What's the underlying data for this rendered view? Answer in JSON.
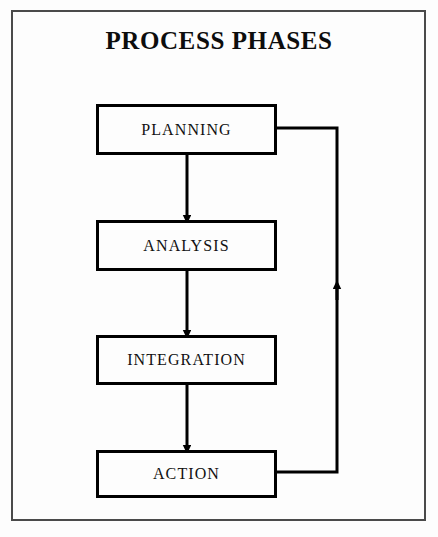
{
  "diagram": {
    "title": "PROCESS PHASES",
    "type": "flowchart",
    "orientation": "vertical",
    "frame_color": "#4a4a4a",
    "box_border_color": "#000000",
    "line_color": "#000000",
    "background_color": "#fdfdfd",
    "nodes": [
      {
        "id": "planning",
        "label": "PLANNING"
      },
      {
        "id": "analysis",
        "label": "ANALYSIS"
      },
      {
        "id": "integration",
        "label": "INTEGRATION"
      },
      {
        "id": "action",
        "label": "ACTION"
      }
    ],
    "edges": [
      {
        "from": "planning",
        "to": "analysis",
        "kind": "arrow-down"
      },
      {
        "from": "analysis",
        "to": "integration",
        "kind": "arrow-down"
      },
      {
        "from": "integration",
        "to": "action",
        "kind": "arrow-down"
      },
      {
        "from": "action",
        "to": "planning",
        "kind": "feedback-loop-right"
      }
    ]
  }
}
